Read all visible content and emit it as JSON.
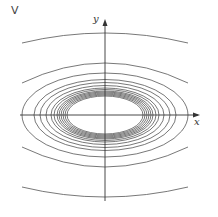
{
  "figure": {
    "panel_label": "V",
    "x_axis_label": "x",
    "y_axis_label": "y"
  },
  "geometry": {
    "center": [
      105,
      115
    ],
    "axis_color": "#333333",
    "curve_color": "#555555",
    "closed_ellipses": [
      {
        "rx": 38,
        "ry": 19
      },
      {
        "rx": 40,
        "ry": 20
      },
      {
        "rx": 42,
        "ry": 21
      },
      {
        "rx": 44,
        "ry": 22
      },
      {
        "rx": 46,
        "ry": 23
      },
      {
        "rx": 48,
        "ry": 24
      },
      {
        "rx": 51,
        "ry": 25.5
      },
      {
        "rx": 54,
        "ry": 27
      },
      {
        "rx": 59,
        "ry": 29.5
      },
      {
        "rx": 65,
        "ry": 32.5
      },
      {
        "rx": 71,
        "ry": 35.5
      },
      {
        "rx": 83,
        "ry": 42
      }
    ],
    "open_arcs": [
      {
        "x1": 22,
        "y1": 43,
        "cy": 33,
        "x2": 188,
        "y2": 43
      },
      {
        "x1": 22,
        "y1": 83,
        "cy": 63,
        "x2": 188,
        "y2": 83
      },
      {
        "x1": 22,
        "y1": 147,
        "cy": 167,
        "x2": 188,
        "y2": 147
      },
      {
        "x1": 22,
        "y1": 187,
        "cy": 197,
        "x2": 188,
        "y2": 187
      }
    ]
  }
}
